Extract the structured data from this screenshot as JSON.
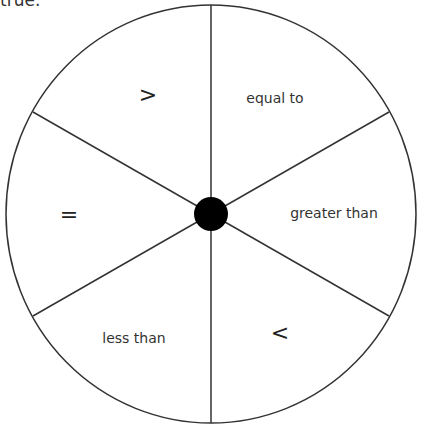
{
  "top_text": "true.",
  "spinner": {
    "sections": [
      {
        "label": ">",
        "x": 148,
        "y": 94
      },
      {
        "label": "equal to",
        "x": 275,
        "y": 98
      },
      {
        "label": "greater than",
        "x": 334,
        "y": 213
      },
      {
        "label": "<",
        "x": 280,
        "y": 332
      },
      {
        "label": "less than",
        "x": 134,
        "y": 338
      },
      {
        "label": "=",
        "x": 69,
        "y": 214
      }
    ],
    "hub_color": "#000000",
    "line_color": "#333333"
  }
}
